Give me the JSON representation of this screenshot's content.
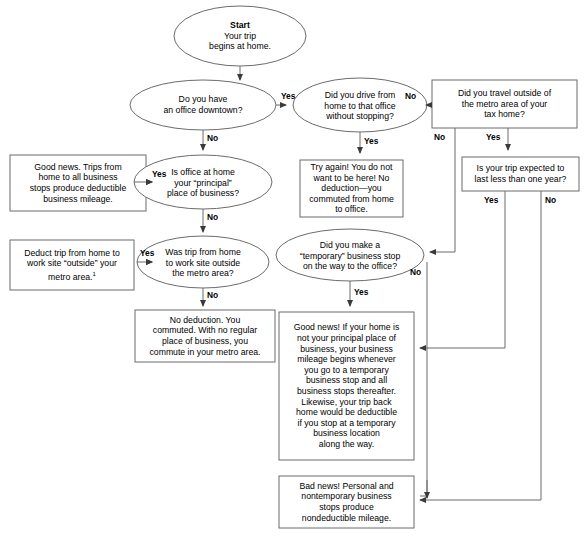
{
  "diagram": {
    "colors": {
      "stroke": "#6b6b6b",
      "fill": "#ffffff",
      "text": "#000000"
    }
  },
  "nodes": {
    "start": {
      "shape": "ellipse",
      "title": "Start",
      "line1": "Your trip",
      "line2": "begins at home."
    },
    "office_downtown": {
      "shape": "ellipse",
      "line1": "Do you have",
      "line2": "an office downtown?"
    },
    "drive_without_stopping": {
      "shape": "ellipse",
      "line1": "Did you drive from",
      "line2": "home to that office",
      "line3": "without stopping?"
    },
    "travel_outside_metro": {
      "shape": "rect",
      "line1": "Did you travel outside of",
      "line2": "the metro area of your",
      "line3": "tax home?"
    },
    "trip_less_than_year": {
      "shape": "rect",
      "line1": "Is your trip expected to",
      "line2": "last less than one year?"
    },
    "good_news_trips": {
      "shape": "rect",
      "line1": "Good news. Trips from",
      "line2": "home to all business",
      "line3": "stops produce deductible",
      "line4": "business mileage."
    },
    "office_home_principal": {
      "shape": "ellipse",
      "line1": "Is office at home",
      "line2": "your “principal”",
      "line3": "place of business?"
    },
    "try_again": {
      "shape": "rect",
      "line1": "Try again! You do not",
      "line2": "want to be here! No",
      "line3": "deduction—you",
      "line4": "commuted from home",
      "line5": "to office."
    },
    "deduct_trip_outside": {
      "shape": "rect",
      "line1": "Deduct trip from home to",
      "line2": "work site “outside” your",
      "line3": "metro area.",
      "footnote": "1"
    },
    "was_trip_outside_metro": {
      "shape": "ellipse",
      "line1": "Was trip from home",
      "line2": "to work site outside",
      "line3": "the metro area?"
    },
    "temporary_stop": {
      "shape": "ellipse",
      "line1": "Did you make a",
      "line2": "“temporary” business stop",
      "line3": "on the way to the office?"
    },
    "no_deduction_commuted": {
      "shape": "rect",
      "line1": "No deduction. You",
      "line2": "commuted. With no regular",
      "line3": "place of business, you",
      "line4": "commute in your metro area."
    },
    "good_news_temporary": {
      "shape": "rect",
      "line1": "Good news! If your home is",
      "line2": "not your principal place of",
      "line3": "business, your business",
      "line4": "mileage begins whenever",
      "line5": "you go to a temporary",
      "line6": "business stop and all",
      "line7": "business stops thereafter.",
      "line8": "Likewise, your trip back",
      "line9": "home would be deductible",
      "line10": "if you stop at a temporary",
      "line11": "business location",
      "line12": "along the way."
    },
    "bad_news": {
      "shape": "rect",
      "line1": "Bad news! Personal and",
      "line2": "nontemporary business",
      "line3": "stops produce",
      "line4": "nondeductible mileage."
    }
  },
  "edge_labels": {
    "office_downtown_yes": "Yes",
    "office_downtown_no": "No",
    "drive_without_stopping_no": "No",
    "drive_without_stopping_yes": "Yes",
    "travel_outside_no": "No",
    "travel_outside_yes": "Yes",
    "trip_less_year_yes": "Yes",
    "trip_less_year_no": "No",
    "office_home_yes": "Yes",
    "office_home_no": "No",
    "was_trip_yes": "Yes",
    "was_trip_no": "No",
    "temporary_stop_yes": "Yes",
    "temporary_stop_no": "No"
  }
}
